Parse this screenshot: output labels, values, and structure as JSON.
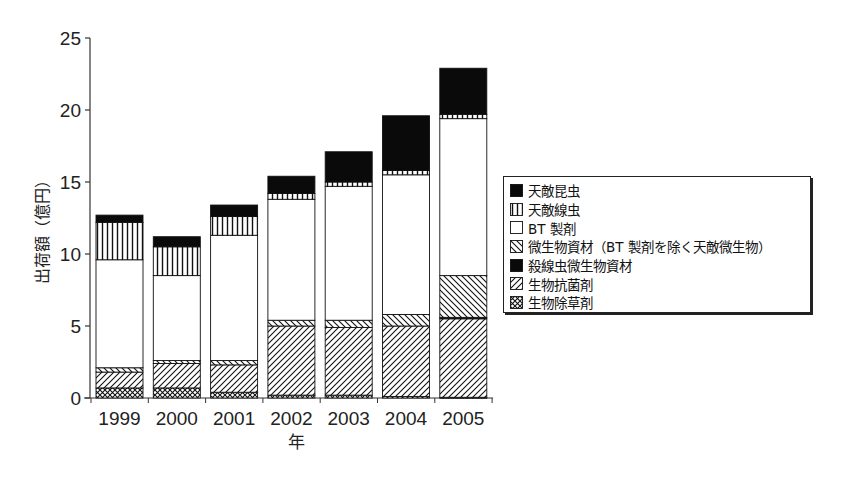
{
  "chart_data": {
    "type": "bar",
    "stacked": true,
    "title": "",
    "xlabel": "年",
    "ylabel": "出荷額（億円）",
    "ylim": [
      0,
      25
    ],
    "yticks": [
      0,
      5,
      10,
      15,
      20,
      25
    ],
    "grid": false,
    "legend_position": "right",
    "categories": [
      "1999",
      "2000",
      "2001",
      "2002",
      "2003",
      "2004",
      "2005"
    ],
    "series": [
      {
        "name": "生物除草剤",
        "pattern": "crosshatch",
        "values": [
          0.7,
          0.7,
          0.4,
          0.2,
          0.2,
          0.1,
          0.05
        ]
      },
      {
        "name": "生物抗菌剤",
        "pattern": "diagonal-up",
        "values": [
          1.1,
          1.7,
          1.9,
          4.8,
          4.7,
          4.9,
          5.45
        ]
      },
      {
        "name": "殺線虫微生物資材",
        "pattern": "solid-black",
        "values": [
          0,
          0,
          0,
          0,
          0,
          0,
          0.1
        ]
      },
      {
        "name": "微生物資材（BT製剤を除く天敵微生物）",
        "pattern": "diagonal-down",
        "values": [
          0.3,
          0.2,
          0.3,
          0.4,
          0.5,
          0.8,
          2.9
        ]
      },
      {
        "name": "BT製剤",
        "pattern": "white",
        "values": [
          7.5,
          5.9,
          8.7,
          8.4,
          9.3,
          9.7,
          10.9
        ]
      },
      {
        "name": "天敵線虫",
        "pattern": "vertical-lines",
        "values": [
          2.6,
          2.0,
          1.3,
          0.4,
          0.3,
          0.3,
          0.3
        ]
      },
      {
        "name": "天敵昆虫",
        "pattern": "solid-black",
        "values": [
          0.5,
          0.7,
          0.8,
          1.2,
          2.1,
          3.8,
          3.2
        ]
      }
    ],
    "totals": [
      12.7,
      11.2,
      13.4,
      15.4,
      17.1,
      19.6,
      22.9
    ]
  },
  "axis": {
    "y_title": "出荷額（億円）",
    "x_title": "年",
    "y_ticks": [
      "0",
      "5",
      "10",
      "15",
      "20",
      "25"
    ],
    "x_ticks": [
      "1999",
      "2000",
      "2001",
      "2002",
      "2003",
      "2004",
      "2005"
    ]
  },
  "legend": {
    "items": [
      {
        "label": "天敵昆虫",
        "pattern": "solid-black"
      },
      {
        "label": "天敵線虫",
        "pattern": "vertical-lines"
      },
      {
        "label": "BT 製剤",
        "pattern": "white"
      },
      {
        "label": "微生物資材（BT 製剤を除く天敵微生物）",
        "pattern": "diagonal-down"
      },
      {
        "label": "殺線虫微生物資材",
        "pattern": "solid-black"
      },
      {
        "label": "生物抗菌剤",
        "pattern": "diagonal-up"
      },
      {
        "label": "生物除草剤",
        "pattern": "crosshatch"
      }
    ]
  }
}
